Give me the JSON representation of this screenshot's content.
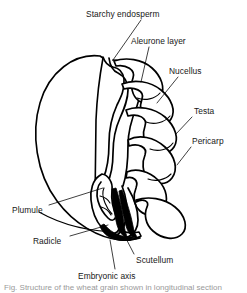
{
  "figure": {
    "ink_color": "#000000",
    "background_color": "#ffffff"
  },
  "labels": [
    {
      "id": "starchy-endosperm",
      "text": "Starchy endosperm",
      "x": 86,
      "y": 9,
      "leader_from": [
        141,
        20
      ],
      "leader_to": [
        113,
        60
      ]
    },
    {
      "id": "aleurone-layer",
      "text": "Aleurone layer",
      "x": 131,
      "y": 36,
      "leader_from": [
        149,
        47
      ],
      "leader_to": [
        141,
        82
      ]
    },
    {
      "id": "nucellus",
      "text": "Nucellus",
      "x": 169,
      "y": 66,
      "leader_from": [
        178,
        77
      ],
      "leader_to": [
        157,
        103
      ]
    },
    {
      "id": "testa",
      "text": "Testa",
      "x": 194,
      "y": 106,
      "leader_from": [
        192,
        117
      ],
      "leader_to": [
        176,
        134
      ]
    },
    {
      "id": "pericarp",
      "text": "Pericarp",
      "x": 192,
      "y": 136,
      "leader_from": [
        191,
        147
      ],
      "leader_to": [
        177,
        165
      ]
    },
    {
      "id": "plumule",
      "text": "Plumule",
      "x": 12,
      "y": 205,
      "leader_from": [
        49,
        205
      ],
      "leader_to": [
        103,
        188
      ]
    },
    {
      "id": "radicle",
      "text": "Radicle",
      "x": 33,
      "y": 236,
      "leader_from": [
        70,
        236
      ],
      "leader_to": [
        108,
        225
      ]
    },
    {
      "id": "scutellum",
      "text": "Scutellum",
      "x": 136,
      "y": 255,
      "leader_from": [
        134,
        254
      ],
      "leader_to": [
        119,
        225
      ]
    },
    {
      "id": "embryonic-axis",
      "text": "Embryonic axis",
      "x": 78,
      "y": 271,
      "leader_from": [
        115,
        269
      ],
      "leader_to": [
        110,
        240
      ]
    }
  ],
  "caption": {
    "text": "Fig. Structure of the wheat grain shown in longitudinal section"
  },
  "structures": [
    {
      "id": "seed-coat-outline",
      "name": "seed coat outer boundary"
    },
    {
      "id": "endosperm-mass",
      "name": "starchy endosperm region"
    },
    {
      "id": "aleurone-band",
      "name": "aleurone layer band"
    },
    {
      "id": "scutellum-body",
      "name": "scutellum"
    },
    {
      "id": "embryo-axis-body",
      "name": "embryonic axis"
    },
    {
      "id": "plumule-body",
      "name": "plumule"
    },
    {
      "id": "radicle-body",
      "name": "radicle"
    },
    {
      "id": "coat-folds",
      "name": "pericarp, testa and nucellus folds"
    }
  ]
}
